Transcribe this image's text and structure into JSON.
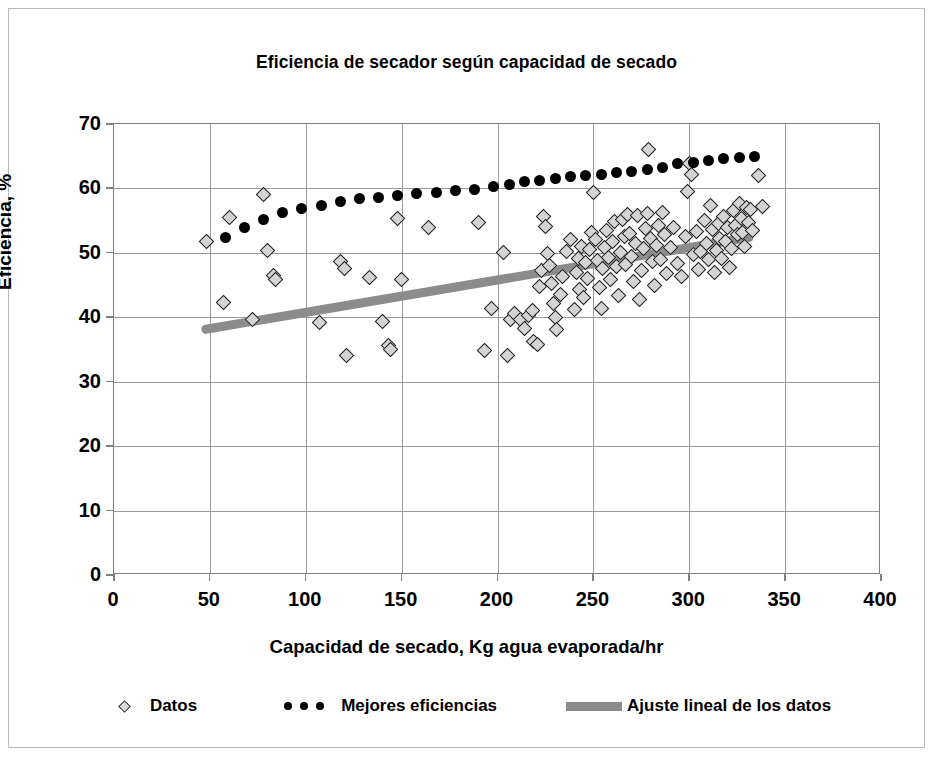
{
  "chart_data": {
    "type": "scatter",
    "title": "Eficiencia de secador según capacidad de secado",
    "xlabel": "Capacidad de secado, Kg agua evaporada/hr",
    "ylabel": "Eficiencia, %",
    "xlim": [
      0,
      400
    ],
    "ylim": [
      0,
      70
    ],
    "xticks": [
      0,
      50,
      100,
      150,
      200,
      250,
      300,
      350,
      400
    ],
    "yticks": [
      0,
      10,
      20,
      30,
      40,
      50,
      60,
      70
    ],
    "grid": true,
    "legend_position": "bottom",
    "series": [
      {
        "name": "Datos",
        "type": "scatter",
        "marker": "diamond",
        "color": "#d4d4d4",
        "edge_color": "#222222",
        "points": [
          [
            48,
            51.8
          ],
          [
            57,
            42.3
          ],
          [
            60,
            55.5
          ],
          [
            72,
            39.6
          ],
          [
            78,
            59.1
          ],
          [
            80,
            50.3
          ],
          [
            83,
            46.5
          ],
          [
            84,
            45.8
          ],
          [
            107,
            39.2
          ],
          [
            118,
            48.6
          ],
          [
            120,
            47.6
          ],
          [
            121,
            34.0
          ],
          [
            133,
            46.1
          ],
          [
            140,
            39.3
          ],
          [
            143,
            35.6
          ],
          [
            144,
            35.0
          ],
          [
            148,
            55.4
          ],
          [
            150,
            45.8
          ],
          [
            164,
            53.9
          ],
          [
            190,
            54.7
          ],
          [
            193,
            34.9
          ],
          [
            197,
            41.4
          ],
          [
            203,
            50.1
          ],
          [
            205,
            34.0
          ],
          [
            207,
            39.7
          ],
          [
            209,
            40.6
          ],
          [
            212,
            39.6
          ],
          [
            214,
            38.2
          ],
          [
            216,
            40.2
          ],
          [
            218,
            41.0
          ],
          [
            219,
            36.2
          ],
          [
            221,
            35.8
          ],
          [
            222,
            44.8
          ],
          [
            223,
            47.3
          ],
          [
            224,
            55.7
          ],
          [
            225,
            54.1
          ],
          [
            226,
            49.9
          ],
          [
            227,
            48.0
          ],
          [
            228,
            45.2
          ],
          [
            229,
            42.2
          ],
          [
            230,
            40.0
          ],
          [
            231,
            38.1
          ],
          [
            233,
            43.5
          ],
          [
            234,
            46.4
          ],
          [
            236,
            50.2
          ],
          [
            238,
            52.1
          ],
          [
            240,
            41.2
          ],
          [
            241,
            47.0
          ],
          [
            242,
            49.1
          ],
          [
            243,
            44.3
          ],
          [
            244,
            51.0
          ],
          [
            245,
            43.0
          ],
          [
            246,
            48.5
          ],
          [
            247,
            46.0
          ],
          [
            248,
            50.5
          ],
          [
            249,
            53.2
          ],
          [
            250,
            59.4
          ],
          [
            251,
            52.0
          ],
          [
            252,
            48.8
          ],
          [
            253,
            44.6
          ],
          [
            254,
            41.3
          ],
          [
            255,
            47.5
          ],
          [
            256,
            50.8
          ],
          [
            257,
            53.5
          ],
          [
            258,
            49.3
          ],
          [
            259,
            45.9
          ],
          [
            260,
            51.7
          ],
          [
            261,
            54.8
          ],
          [
            262,
            47.9
          ],
          [
            263,
            43.4
          ],
          [
            264,
            50.0
          ],
          [
            265,
            55.2
          ],
          [
            266,
            52.6
          ],
          [
            267,
            48.2
          ],
          [
            268,
            56.0
          ],
          [
            269,
            53.0
          ],
          [
            270,
            49.5
          ],
          [
            271,
            45.6
          ],
          [
            272,
            51.4
          ],
          [
            273,
            55.8
          ],
          [
            274,
            42.7
          ],
          [
            275,
            47.2
          ],
          [
            276,
            50.6
          ],
          [
            277,
            53.8
          ],
          [
            278,
            56.1
          ],
          [
            279,
            66.0
          ],
          [
            280,
            52.3
          ],
          [
            281,
            48.7
          ],
          [
            282,
            45.0
          ],
          [
            283,
            51.1
          ],
          [
            284,
            54.3
          ],
          [
            285,
            49.0
          ],
          [
            286,
            56.3
          ],
          [
            287,
            52.8
          ],
          [
            288,
            46.8
          ],
          [
            290,
            50.9
          ],
          [
            292,
            54.0
          ],
          [
            294,
            48.4
          ],
          [
            296,
            46.3
          ],
          [
            298,
            52.5
          ],
          [
            299,
            59.6
          ],
          [
            300,
            63.9
          ],
          [
            301,
            62.1
          ],
          [
            302,
            49.7
          ],
          [
            304,
            53.3
          ],
          [
            305,
            47.4
          ],
          [
            306,
            50.2
          ],
          [
            308,
            55.0
          ],
          [
            309,
            51.5
          ],
          [
            310,
            48.9
          ],
          [
            311,
            57.4
          ],
          [
            312,
            53.6
          ],
          [
            313,
            46.9
          ],
          [
            314,
            50.4
          ],
          [
            315,
            54.5
          ],
          [
            316,
            52.2
          ],
          [
            317,
            49.2
          ],
          [
            318,
            55.6
          ],
          [
            319,
            51.8
          ],
          [
            320,
            53.9
          ],
          [
            321,
            47.8
          ],
          [
            322,
            50.7
          ],
          [
            323,
            56.6
          ],
          [
            324,
            54.2
          ],
          [
            325,
            52.9
          ],
          [
            326,
            57.6
          ],
          [
            327,
            55.3
          ],
          [
            328,
            53.1
          ],
          [
            329,
            51.0
          ],
          [
            330,
            57.0
          ],
          [
            331,
            54.7
          ],
          [
            332,
            56.8
          ],
          [
            333,
            53.4
          ],
          [
            336,
            62.0
          ],
          [
            338,
            57.2
          ]
        ]
      },
      {
        "name": "Mejores eficiencias",
        "type": "scatter",
        "marker": "circle",
        "color": "#000000",
        "points": [
          [
            58,
            52.4
          ],
          [
            68,
            54.0
          ],
          [
            78,
            55.1
          ],
          [
            88,
            56.3
          ],
          [
            98,
            56.9
          ],
          [
            108,
            57.4
          ],
          [
            118,
            57.9
          ],
          [
            128,
            58.4
          ],
          [
            138,
            58.6
          ],
          [
            148,
            58.9
          ],
          [
            158,
            59.2
          ],
          [
            168,
            59.4
          ],
          [
            178,
            59.7
          ],
          [
            188,
            59.9
          ],
          [
            198,
            60.3
          ],
          [
            206,
            60.6
          ],
          [
            214,
            61.0
          ],
          [
            222,
            61.2
          ],
          [
            230,
            61.5
          ],
          [
            238,
            61.8
          ],
          [
            246,
            62.0
          ],
          [
            254,
            62.2
          ],
          [
            262,
            62.5
          ],
          [
            270,
            62.7
          ],
          [
            278,
            63.0
          ],
          [
            286,
            63.3
          ],
          [
            294,
            63.8
          ],
          [
            302,
            64.1
          ],
          [
            310,
            64.4
          ],
          [
            318,
            64.6
          ],
          [
            326,
            64.8
          ],
          [
            334,
            64.9
          ]
        ]
      },
      {
        "name": "Ajuste lineal de los datos",
        "type": "line",
        "color": "#8c8c8c",
        "width": 9,
        "endpoints": [
          [
            48,
            38.0
          ],
          [
            332,
            52.3
          ]
        ]
      }
    ],
    "legend": [
      {
        "label": "Datos",
        "key": "diamond-marker"
      },
      {
        "label": "Mejores eficiencias",
        "key": "dotted-marker"
      },
      {
        "label": "Ajuste lineal de los datos",
        "key": "thick-line"
      }
    ]
  }
}
